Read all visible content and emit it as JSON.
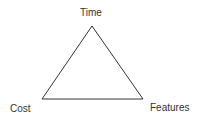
{
  "diagram": {
    "vertices": {
      "top": {
        "label": "Time"
      },
      "bottom_left": {
        "label": "Cost"
      },
      "bottom_right": {
        "label": "Features"
      }
    },
    "stroke_color": "#333333"
  }
}
